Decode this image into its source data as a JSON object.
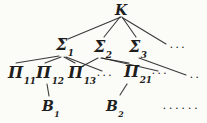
{
  "colors": {
    "background": "#fbfbf8",
    "ink": "#1e1e1e"
  },
  "nodes": {
    "k": {
      "main": "K"
    },
    "sigma1": {
      "main": "Σ",
      "sub": "1"
    },
    "sigma2": {
      "main": "Σ",
      "sub": "2"
    },
    "sigma3": {
      "main": "Σ",
      "sub": "3"
    },
    "pi11": {
      "main": "Π",
      "sub": "11"
    },
    "pi12": {
      "main": "Π",
      "sub": "12"
    },
    "pi13": {
      "main": "Π",
      "sub": "13"
    },
    "pi21": {
      "main": "Π",
      "sub": "21"
    },
    "b1": {
      "main": "B",
      "sub": "1"
    },
    "b2": {
      "main": "B",
      "sub": "2"
    }
  },
  "ellipses": {
    "after_k": "...",
    "after_pi13": "...",
    "after_pi21": "...",
    "right_mid": "..",
    "bottom_right": "......"
  }
}
